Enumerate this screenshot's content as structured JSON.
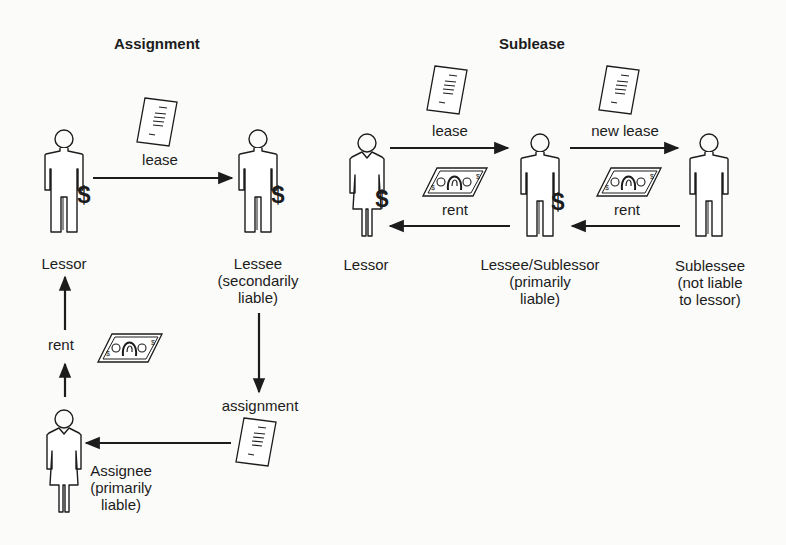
{
  "assignment": {
    "title": "Assignment",
    "lessor_label": "Lessor",
    "lessee_label": "Lessee\n(secondarily\nliable)",
    "assignee_label": "Assignee\n(primarily\nliable)",
    "lease_label": "lease",
    "rent_label": "rent",
    "assignment_label": "assignment",
    "dollar": "$"
  },
  "sublease": {
    "title": "Sublease",
    "lessor_label": "Lessor",
    "lessee_label": "Lessee/Sublessor\n(primarily\nliable)",
    "sublessee_label": "Sublessee\n(not liable\nto lessor)",
    "lease_label": "lease",
    "new_lease_label": "new lease",
    "rent_label_1": "rent",
    "rent_label_2": "rent",
    "dollar": "$"
  },
  "colors": {
    "ink": "#1c1c1c",
    "background": "#fbfbfa"
  }
}
